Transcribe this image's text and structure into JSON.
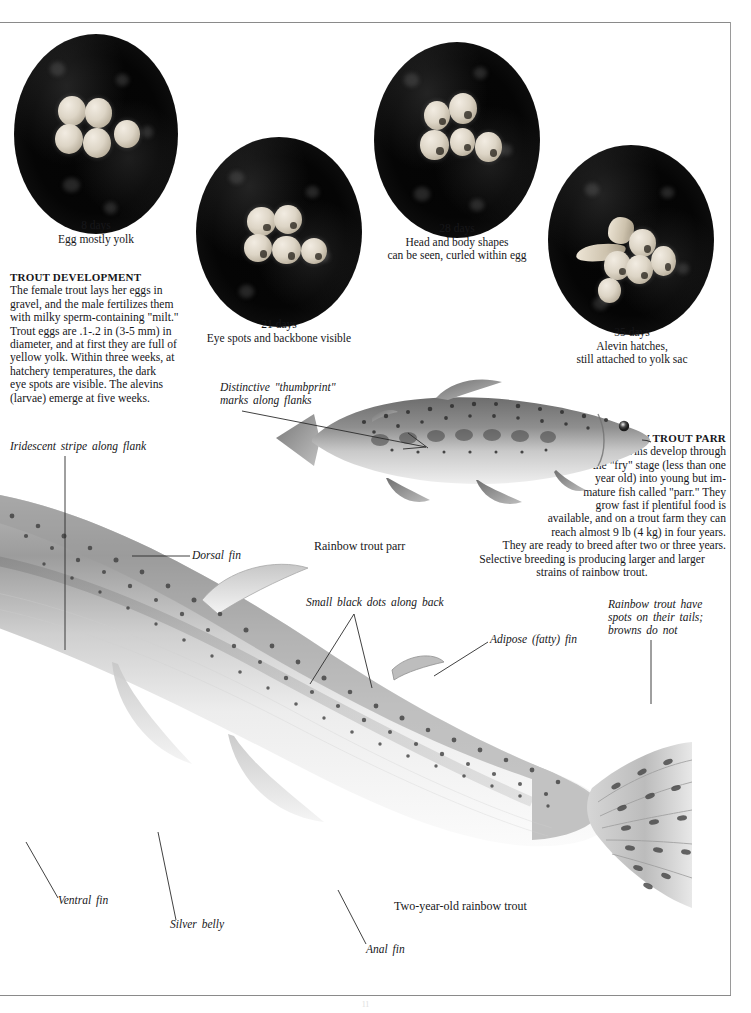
{
  "page": {
    "page_number": "11"
  },
  "egg_stages": [
    {
      "id": "stage-8-days",
      "days": "8 days",
      "caption": "8 days\nEgg mostly yolk"
    },
    {
      "id": "stage-21-days",
      "days": "21 days",
      "caption": "21 days\nEye spots and backbone visible"
    },
    {
      "id": "stage-28-days",
      "days": "28 days",
      "caption": "28 days\nHead and body shapes\ncan be seen, curled within egg"
    },
    {
      "id": "stage-35-days",
      "days": "35 days",
      "caption": "35 days\nAlevin hatches,\nstill attached to yolk sac"
    }
  ],
  "trout_development": {
    "heading": "TROUT DEVELOPMENT",
    "body": "The female trout lays her eggs in\ngravel, and the male fertilizes them\nwith milky sperm-containing \"milt.\"\nTrout eggs are .1-.2 in (3-5 mm) in\ndiameter, and at first they are full of\nyellow yolk. Within three weeks, at\nhatchery temperatures, the dark\neye spots are visible. The alevins\n(larvae) emerge at five weeks."
  },
  "rainbow_trout_parr": {
    "heading": "RAINBOW TROUT PARR",
    "body": "Alevins develop through\nthe \"fry\" stage (less than one\nyear old) into young but im-\nmature fish called \"parr.\" They\ngrow fast if plentiful food is\navailable, and on a trout farm they can\nreach almost 9 lb (4 kg) in four years.\nThey are ready to breed after two or three years.",
    "last_lines": "Selective breeding is producing larger and larger\nstrains of rainbow trout."
  },
  "callouts": {
    "thumbprint": "Distinctive  \"thumbprint\"\nmarks  along  flanks",
    "parr_caption": "Rainbow trout parr",
    "iridescent_stripe": "Iridescent  stripe  along  flank",
    "dorsal_fin": "Dorsal  fin",
    "small_black_dots": "Small  black  dots  along  back",
    "adipose_fin": "Adipose  (fatty)  fin",
    "tail_spots": "Rainbow  trout  have\nspots  on  their  tails;\nbrowns  do  not",
    "ventral_fin": "Ventral  fin",
    "silver_belly": "Silver  belly",
    "anal_fin": "Anal  fin",
    "two_year_old": "Two-year-old rainbow trout"
  },
  "colors": {
    "page_background": "#ffffff",
    "text": "#17171a",
    "rule": "#8a8a8a",
    "photo_background": "#040404",
    "egg_highlight": "#f2ece2"
  }
}
